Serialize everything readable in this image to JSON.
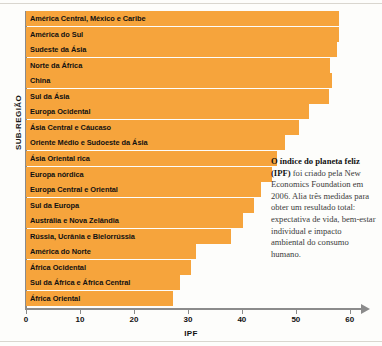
{
  "chart_data": {
    "type": "bar",
    "orientation": "horizontal",
    "title": "",
    "xlabel": "IPF",
    "ylabel": "SUB-REGIÃO",
    "xlim": [
      0,
      63
    ],
    "xticks": [
      0,
      10,
      20,
      30,
      40,
      50,
      60
    ],
    "grid": false,
    "legend": null,
    "bar_color": "#f6a43c",
    "categories": [
      "América Central, México e Caribe",
      "América do Sul",
      "Sudeste da Ásia",
      "Norte da África",
      "China",
      "Sul da Ásia",
      "Europa Ocidental",
      "Ásia Central e Cáucaso",
      "Oriente Médio e Sudoeste da Ásia",
      "Ásia Oriental rica",
      "Europa nórdica",
      "Europa Central e Oriental",
      "Sul da Europa",
      "Austrália e Nova Zelândia",
      "Rússia, Ucrânia e Bielorrússia",
      "América do Norte",
      "África Ocidental",
      "Sul da África e África Central",
      "África Oriental"
    ],
    "values": [
      58.0,
      58.0,
      57.6,
      56.3,
      56.7,
      56.2,
      52.5,
      50.5,
      48.0,
      46.5,
      45.5,
      43.6,
      42.3,
      40.2,
      38.0,
      31.5,
      30.5,
      28.5,
      27.2
    ]
  },
  "annotation": {
    "bold_lead": "O índice do planeta feliz (IPF)",
    "body": " foi criado pela New Economics Foundation em 2006. Alia três medidas para obter um resultado total: expectativa de vida, bem-estar individual e impacto ambiental do consumo humano."
  }
}
